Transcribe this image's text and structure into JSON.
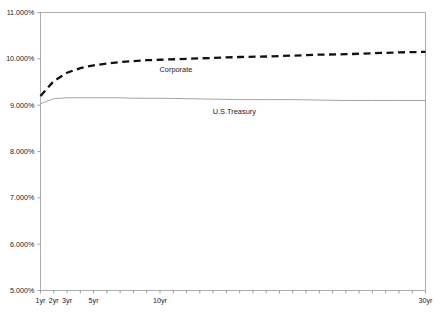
{
  "title": "",
  "chart_data": {
    "type": "line",
    "title": "",
    "subtitle": "",
    "xlabel": "",
    "ylabel": "",
    "grid": false,
    "legend_position": "inline-annotation",
    "ylim": [
      5.0,
      11.0
    ],
    "ytick_labels": [
      "11.000%",
      "10.000%",
      "9.000%",
      "8.000%",
      "7.000%",
      "6.000%",
      "5.000%"
    ],
    "ytick_values": [
      11.0,
      10.0,
      9.0,
      8.0,
      7.0,
      6.0,
      5.0
    ],
    "xtick_labels": [
      "1yr",
      "2yr",
      "3yr",
      "5yr",
      "10yr",
      "30yr"
    ],
    "xtick_values": [
      1,
      2,
      3,
      5,
      10,
      30
    ],
    "x_minor_tick_count": 29,
    "xlim": [
      1,
      30
    ],
    "x": [
      1,
      2,
      3,
      4,
      5,
      6,
      7,
      8,
      9,
      10,
      12,
      14,
      16,
      18,
      20,
      22,
      24,
      26,
      28,
      30
    ],
    "series": [
      {
        "name": "Corporate",
        "style": "dashed",
        "color": "#111111",
        "label_x": 11.2,
        "label_y": 9.72,
        "values": [
          9.2,
          9.52,
          9.7,
          9.8,
          9.86,
          9.9,
          9.93,
          9.95,
          9.97,
          9.98,
          10.0,
          10.02,
          10.04,
          10.05,
          10.07,
          10.09,
          10.1,
          10.12,
          10.14,
          10.15
        ]
      },
      {
        "name": "U.S.Treasury",
        "style": "solid",
        "color": "#9a9a9a",
        "label_x": 15.6,
        "label_y": 8.8,
        "values": [
          9.03,
          9.14,
          9.16,
          9.16,
          9.16,
          9.16,
          9.16,
          9.15,
          9.15,
          9.15,
          9.14,
          9.13,
          9.12,
          9.12,
          9.12,
          9.11,
          9.1,
          9.1,
          9.1,
          9.1
        ]
      }
    ]
  }
}
